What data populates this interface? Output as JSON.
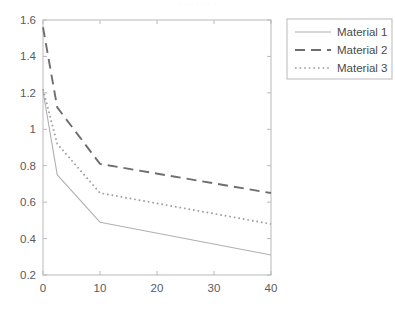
{
  "figure": {
    "top_fragment_text": "·   ·   ·      ·        ·   ·          ·",
    "background_color": "#ffffff",
    "axis_color": "#b9b9bd",
    "tick_label_color": "#5a5a5a"
  },
  "chart_data": {
    "type": "line",
    "title": "",
    "subtitle": "",
    "xlabel": "",
    "ylabel": "",
    "xlim": [
      0,
      40
    ],
    "ylim": [
      0.2,
      1.6
    ],
    "xticks": [
      0,
      10,
      20,
      30,
      40
    ],
    "xtick_labels": [
      "0",
      "10",
      "20",
      "30",
      "40"
    ],
    "yticks": [
      0.2,
      0.4,
      0.6,
      0.8,
      1.0,
      1.2,
      1.4,
      1.6
    ],
    "ytick_labels": [
      "0.2",
      "0.4",
      "0.6",
      "0.8",
      "1",
      "1.2",
      "1.4",
      "1.6"
    ],
    "grid": false,
    "legend_position": "right-outside",
    "series": [
      {
        "name": "Material 1",
        "style": "solid",
        "color": "#b0b0b4",
        "x": [
          0,
          2.5,
          10,
          40
        ],
        "values": [
          1.21,
          0.75,
          0.49,
          0.31
        ]
      },
      {
        "name": "Material 2",
        "style": "dashed",
        "color": "#6e6e72",
        "x": [
          0,
          2.5,
          10,
          40
        ],
        "values": [
          1.56,
          1.12,
          0.81,
          0.65
        ]
      },
      {
        "name": "Material 3",
        "style": "dotted",
        "color": "#9a9a9e",
        "x": [
          0,
          2.5,
          10,
          40
        ],
        "values": [
          1.22,
          0.92,
          0.65,
          0.48
        ]
      }
    ]
  },
  "legend": {
    "items": [
      {
        "label": "Material 1"
      },
      {
        "label": "Material 2"
      },
      {
        "label": "Material 3"
      }
    ]
  }
}
